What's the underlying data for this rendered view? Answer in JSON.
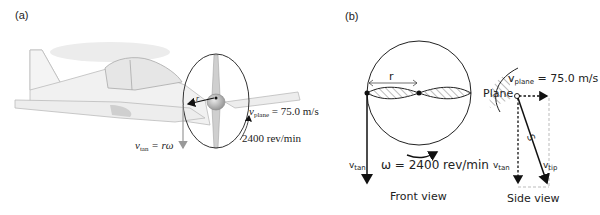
{
  "panel_a": {
    "label": "(a)",
    "radius_label": "r",
    "v_plane_label": "v",
    "v_plane_sub": "plane",
    "v_plane_value": "= 75.0 m/s",
    "rpm_label": "2400 rev/min",
    "v_tan_label": "v",
    "v_tan_sub": "tan",
    "v_tan_value": "= rω"
  },
  "panel_b": {
    "label": "(b)",
    "front_view": {
      "radius_label": "r",
      "v_tan_label": "v",
      "v_tan_sub": "tan",
      "omega_label": "ω = 2400 rev/min",
      "caption": "Front view"
    },
    "side_view": {
      "v_plane_label": "v",
      "v_plane_sub": "plane",
      "v_plane_value": "= 75.0 m/s",
      "plane_label": "Plane",
      "angle_label": "S",
      "v_tan_label": "v",
      "v_tan_sub": "tan",
      "v_tip_label": "v",
      "v_tip_sub": "tip",
      "caption": "Side view"
    }
  }
}
